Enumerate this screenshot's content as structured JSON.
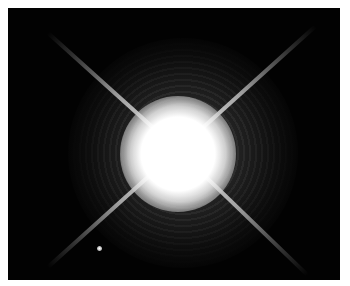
{
  "image": {
    "subject": "Bright star with four diffraction spikes and a faint companion star",
    "description": "Astronomical photograph: a saturated white stellar core with a grainy halo and an X-shaped pattern of diffraction spikes on a black background; a small faint point source lies to the lower left.",
    "colors": {
      "background": "#020202",
      "core": "#ffffff",
      "halo": "#8a8a8a",
      "frame": "#ffffff"
    },
    "elements": {
      "primary_star": "bright-star",
      "companion_star": "faint-companion",
      "spikes": [
        "upper-left",
        "upper-right",
        "lower-left",
        "lower-right"
      ]
    }
  }
}
